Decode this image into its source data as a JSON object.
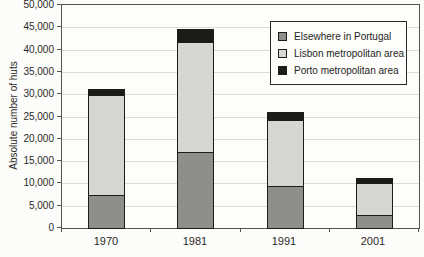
{
  "chart_data": {
    "type": "bar",
    "stacked": true,
    "title": "",
    "xlabel": "",
    "ylabel": "Absolute number of huts",
    "categories": [
      "1970",
      "1981",
      "1991",
      "2001"
    ],
    "series": [
      {
        "name": "Elsewhere in Portugal",
        "color": "#8e8e8c",
        "values": [
          7400,
          17000,
          9400,
          3000
        ]
      },
      {
        "name": "Lisbon metropolitan area",
        "color": "#d6d6d3",
        "values": [
          22500,
          24800,
          14900,
          7100
        ]
      },
      {
        "name": "Porto metropolitan area",
        "color": "#1b1b19",
        "values": [
          1200,
          2900,
          1800,
          1000
        ]
      }
    ],
    "totals": [
      31100,
      44700,
      26100,
      11100
    ],
    "ylim": [
      0,
      50000
    ],
    "ytick_step": 5000,
    "y_tick_labels": [
      "0",
      "5,000",
      "10,000",
      "15,000",
      "20,000",
      "25,000",
      "30,000",
      "35,000",
      "40,000",
      "45,000",
      "50,000"
    ],
    "grid": "horizontal",
    "legend_position": "top-right",
    "style": {
      "background": "#fcfcfa",
      "gridline_color": "#dbdbd8",
      "axis_color": "#55534f",
      "text_color": "#2b2a28",
      "bar_border_color": "#1d1c1a",
      "legend_border_color": "#2a2927"
    }
  }
}
